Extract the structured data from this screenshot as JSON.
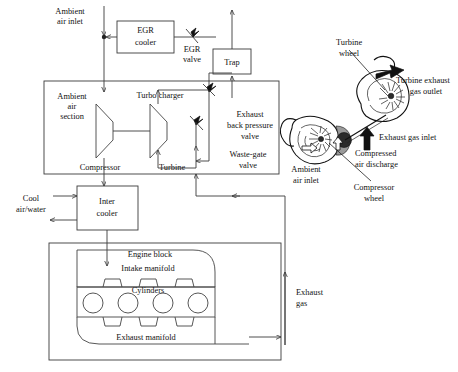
{
  "diagram": {
    "labels": {
      "ambient_air_inlet_top": "Ambient\nair inlet",
      "ambient_air_inlet_top_l1": "Ambient",
      "ambient_air_inlet_top_l2": "air inlet",
      "egr_cooler_l1": "EGR",
      "egr_cooler_l2": "cooler",
      "egr_valve_l1": "EGR",
      "egr_valve_l2": "valve",
      "trap": "Trap",
      "ambient_air_section_l1": "Ambient",
      "ambient_air_section_l2": "air",
      "ambient_air_section_l3": "section",
      "turbo_charger": "Turbo charger",
      "compressor": "Compressor",
      "turbine": "Turbine",
      "exhaust_back_pressure_valve_l1": "Exhaust",
      "exhaust_back_pressure_valve_l2": "back pressure",
      "exhaust_back_pressure_valve_l3": "valve",
      "waste_gate_valve_l1": "Waste-gate",
      "waste_gate_valve_l2": "valve",
      "cool_air_water_l1": "Cool",
      "cool_air_water_l2": "air/water",
      "inter_cooler_l1": "Inter",
      "inter_cooler_l2": "cooler",
      "engine_block": "Engine block",
      "intake_manifold": "Intake manifold",
      "cylinders": "Cylinders",
      "exhaust_manifold": "Exhaust manifold",
      "exhaust_gas_l1": "Exhaust",
      "exhaust_gas_l2": "gas",
      "turbine_wheel_l1": "Turbine",
      "turbine_wheel_l2": "wheel",
      "turbine_exhaust_gas_outlet_l1": "Turbine exhaust",
      "turbine_exhaust_gas_outlet_l2": "gas outlet",
      "exhaust_gas_inlet": "Exhaust gas inlet",
      "compressed_air_discharge_l1": "Compressed",
      "compressed_air_discharge_l2": "air discharge",
      "compressor_wheel_l1": "Compressor",
      "compressor_wheel_l2": "wheel",
      "ambient_air_inlet_turbo_l1": "Ambient",
      "ambient_air_inlet_turbo_l2": "air inlet"
    },
    "components": [
      {
        "name": "egr-cooler",
        "label": "EGR cooler",
        "type": "box"
      },
      {
        "name": "egr-valve",
        "label": "EGR valve",
        "type": "valve"
      },
      {
        "name": "trap",
        "label": "Trap",
        "type": "box"
      },
      {
        "name": "turbo-charger",
        "label": "Turbo charger",
        "type": "group-box"
      },
      {
        "name": "compressor",
        "label": "Compressor",
        "type": "trapezoid"
      },
      {
        "name": "turbine",
        "label": "Turbine",
        "type": "trapezoid"
      },
      {
        "name": "exhaust-back-pressure-valve",
        "label": "Exhaust back pressure valve",
        "type": "valve"
      },
      {
        "name": "waste-gate-valve",
        "label": "Waste-gate valve",
        "type": "valve"
      },
      {
        "name": "inter-cooler",
        "label": "Inter cooler",
        "type": "box"
      },
      {
        "name": "engine-block",
        "label": "Engine block",
        "type": "group-box"
      },
      {
        "name": "intake-manifold",
        "label": "Intake manifold",
        "type": "manifold"
      },
      {
        "name": "cylinders",
        "label": "Cylinders",
        "type": "circles",
        "count": 4
      },
      {
        "name": "exhaust-manifold",
        "label": "Exhaust manifold",
        "type": "manifold"
      },
      {
        "name": "turbocharger-cutaway",
        "label": "Turbocharger cutaway illustration",
        "type": "illustration"
      }
    ],
    "colors": {
      "line": "#3a3a3a",
      "text": "#111111",
      "background": "#ffffff",
      "illustration_dark": "#2b2b2b",
      "illustration_grey": "#9a9a9a"
    }
  }
}
